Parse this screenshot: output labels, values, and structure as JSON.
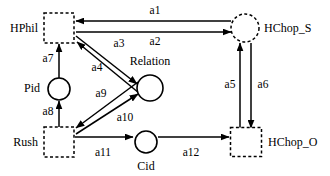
{
  "diagram": {
    "background_color": "#ffffff",
    "stroke_color": "#000000",
    "nodes": [
      {
        "id": "HPhil",
        "label": "HPhil",
        "shape": "dashed-square",
        "cx": 59,
        "cy": 28,
        "w": 30,
        "h": 30,
        "label_x": 38,
        "label_y": 32,
        "label_anchor": "end"
      },
      {
        "id": "HChopS",
        "label": "HChop_S",
        "shape": "dashed-circle",
        "cx": 245,
        "cy": 28,
        "r": 14,
        "label_x": 264,
        "label_y": 32,
        "label_anchor": "start"
      },
      {
        "id": "Pid",
        "label": "Pid",
        "shape": "solid-circle",
        "cx": 59,
        "cy": 89,
        "r": 11,
        "label_x": 40,
        "label_y": 92,
        "label_anchor": "end"
      },
      {
        "id": "Relation",
        "label": "Relation",
        "shape": "solid-circle",
        "cx": 150,
        "cy": 88,
        "r": 13,
        "label_x": 150,
        "label_y": 65,
        "label_anchor": "middle"
      },
      {
        "id": "Rush",
        "label": "Rush",
        "shape": "dashed-square",
        "cx": 59,
        "cy": 142,
        "w": 30,
        "h": 30,
        "label_x": 38,
        "label_y": 146,
        "label_anchor": "end"
      },
      {
        "id": "Cid",
        "label": "Cid",
        "shape": "solid-circle",
        "cx": 146,
        "cy": 142,
        "r": 11,
        "label_x": 146,
        "label_y": 170,
        "label_anchor": "middle"
      },
      {
        "id": "HChopO",
        "label": "HChop_O",
        "shape": "dashed-square",
        "cx": 246,
        "cy": 142,
        "w": 31,
        "h": 29,
        "label_x": 268,
        "label_y": 146,
        "label_anchor": "start"
      }
    ],
    "edges": [
      {
        "id": "a1",
        "label": "a1",
        "from": "HChopS",
        "to": "HPhil",
        "path": "M 231 21 L 76 21",
        "label_x": 155,
        "label_y": 14,
        "label_anchor": "middle"
      },
      {
        "id": "a2",
        "label": "a2",
        "from": "HPhil",
        "to": "HChopS",
        "path": "M 76 32 L 231 32",
        "label_x": 155,
        "label_y": 45,
        "label_anchor": "middle"
      },
      {
        "id": "a3",
        "label": "a3",
        "from": "HPhil",
        "to": "Relation",
        "path": "M 76 36 L 137 84",
        "label_x": 119,
        "label_y": 47,
        "label_anchor": "middle"
      },
      {
        "id": "a4",
        "label": "a4",
        "from": "Relation",
        "to": "HPhil",
        "path": "M 139 93 L 77 42",
        "label_x": 97,
        "label_y": 71,
        "label_anchor": "middle"
      },
      {
        "id": "a5",
        "label": "a5",
        "from": "HChopO",
        "to": "HChopS",
        "path": "M 240 128 L 240 43",
        "label_x": 230,
        "label_y": 88,
        "label_anchor": "middle"
      },
      {
        "id": "a6",
        "label": "a6",
        "from": "HChopS",
        "to": "HChopO",
        "path": "M 251 43 L 251 128",
        "label_x": 263,
        "label_y": 88,
        "label_anchor": "middle"
      },
      {
        "id": "a7",
        "label": "a7",
        "from": "Pid",
        "to": "HPhil",
        "path": "M 59 78 L 59 44",
        "label_x": 48,
        "label_y": 62,
        "label_anchor": "middle"
      },
      {
        "id": "a8",
        "label": "a8",
        "from": "Rush",
        "to": "Pid",
        "path": "M 59 128 L 59 101",
        "label_x": 48,
        "label_y": 115,
        "label_anchor": "middle"
      },
      {
        "id": "a9",
        "label": "a9",
        "from": "Relation",
        "to": "Rush",
        "path": "M 138 82 L 76 128",
        "label_x": 101,
        "label_y": 97,
        "label_anchor": "middle"
      },
      {
        "id": "a10",
        "label": "a10",
        "from": "Rush",
        "to": "Relation",
        "path": "M 76 134 L 138 94",
        "label_x": 125,
        "label_y": 121,
        "label_anchor": "middle"
      },
      {
        "id": "a11",
        "label": "a11",
        "from": "Rush",
        "to": "Cid",
        "path": "M 75 137 L 133 137",
        "label_x": 103,
        "label_y": 156,
        "label_anchor": "middle"
      },
      {
        "id": "a12",
        "label": "a12",
        "from": "Cid",
        "to": "HChopO",
        "path": "M 158 137 L 229 137",
        "label_x": 191,
        "label_y": 156,
        "label_anchor": "middle"
      }
    ]
  }
}
